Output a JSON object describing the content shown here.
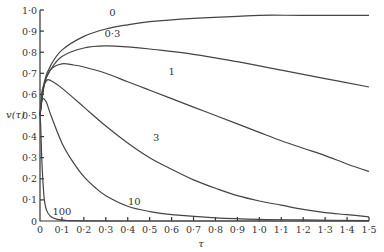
{
  "chart_data": {
    "type": "line",
    "title": "",
    "xlabel": "τ",
    "ylabel": "v(τ)",
    "xlim": [
      0,
      1.5
    ],
    "ylim": [
      0,
      1.0
    ],
    "grid": false,
    "legend": "inline curve labels",
    "x_ticks": [
      "0",
      "0·1",
      "0·2",
      "0·3",
      "0·4",
      "0·5",
      "0·6",
      "0·7",
      "0·8",
      "0·9",
      "1·0",
      "1·1",
      "1·2",
      "1·3",
      "1·4",
      "1·5"
    ],
    "y_ticks": [
      "0",
      "0·1",
      "0·2",
      "0·3",
      "0·4",
      "0·5",
      "0·6",
      "0·7",
      "0·8",
      "0·9",
      "1·0"
    ],
    "series": [
      {
        "name": "0",
        "label_pos": [
          0.33,
          0.97
        ],
        "x": [
          0,
          0.02,
          0.05,
          0.1,
          0.2,
          0.3,
          0.4,
          0.5,
          0.7,
          0.9,
          1.0,
          1.2,
          1.5
        ],
        "y": [
          0.5,
          0.66,
          0.74,
          0.81,
          0.875,
          0.91,
          0.93,
          0.945,
          0.96,
          0.97,
          0.975,
          0.975,
          0.975
        ]
      },
      {
        "name": "0·3",
        "label_pos": [
          0.33,
          0.87
        ],
        "x": [
          0,
          0.02,
          0.05,
          0.1,
          0.2,
          0.3,
          0.4,
          0.5,
          0.7,
          0.9,
          1.1,
          1.3,
          1.5
        ],
        "y": [
          0.5,
          0.65,
          0.72,
          0.78,
          0.82,
          0.83,
          0.825,
          0.815,
          0.79,
          0.755,
          0.715,
          0.675,
          0.635
        ]
      },
      {
        "name": "1",
        "label_pos": [
          0.6,
          0.69
        ],
        "x": [
          0,
          0.02,
          0.05,
          0.1,
          0.15,
          0.2,
          0.3,
          0.4,
          0.5,
          0.6,
          0.7,
          0.8,
          0.9,
          1.0,
          1.1,
          1.2,
          1.3,
          1.4,
          1.5
        ],
        "y": [
          0.5,
          0.65,
          0.72,
          0.745,
          0.74,
          0.73,
          0.7,
          0.66,
          0.62,
          0.58,
          0.54,
          0.5,
          0.46,
          0.42,
          0.38,
          0.345,
          0.31,
          0.27,
          0.235
        ]
      },
      {
        "name": "3",
        "label_pos": [
          0.53,
          0.38
        ],
        "x": [
          0,
          0.01,
          0.03,
          0.05,
          0.1,
          0.2,
          0.3,
          0.4,
          0.5,
          0.6,
          0.7,
          0.8,
          0.9,
          1.0,
          1.1,
          1.2,
          1.3,
          1.4,
          1.5
        ],
        "y": [
          0.5,
          0.62,
          0.665,
          0.665,
          0.63,
          0.54,
          0.45,
          0.37,
          0.3,
          0.245,
          0.195,
          0.155,
          0.12,
          0.095,
          0.075,
          0.055,
          0.04,
          0.03,
          0.02
        ]
      },
      {
        "name": "10",
        "label_pos": [
          0.43,
          0.075
        ],
        "x": [
          0,
          0.005,
          0.015,
          0.03,
          0.05,
          0.1,
          0.15,
          0.2,
          0.25,
          0.3,
          0.4,
          0.5,
          0.6,
          0.8,
          1.0,
          1.2,
          1.5
        ],
        "y": [
          0.5,
          0.56,
          0.58,
          0.56,
          0.5,
          0.37,
          0.28,
          0.21,
          0.16,
          0.12,
          0.07,
          0.045,
          0.03,
          0.015,
          0.008,
          0.005,
          0.002
        ]
      },
      {
        "name": "100",
        "label_pos": [
          0.1,
          0.03
        ],
        "x": [
          0,
          0.003,
          0.007,
          0.01,
          0.015,
          0.02,
          0.03,
          0.05,
          0.08,
          0.12,
          0.2,
          0.4,
          1.5
        ],
        "y": [
          0.5,
          0.45,
          0.33,
          0.25,
          0.16,
          0.1,
          0.05,
          0.02,
          0.008,
          0.003,
          0.001,
          0.0,
          0.0
        ]
      }
    ]
  }
}
